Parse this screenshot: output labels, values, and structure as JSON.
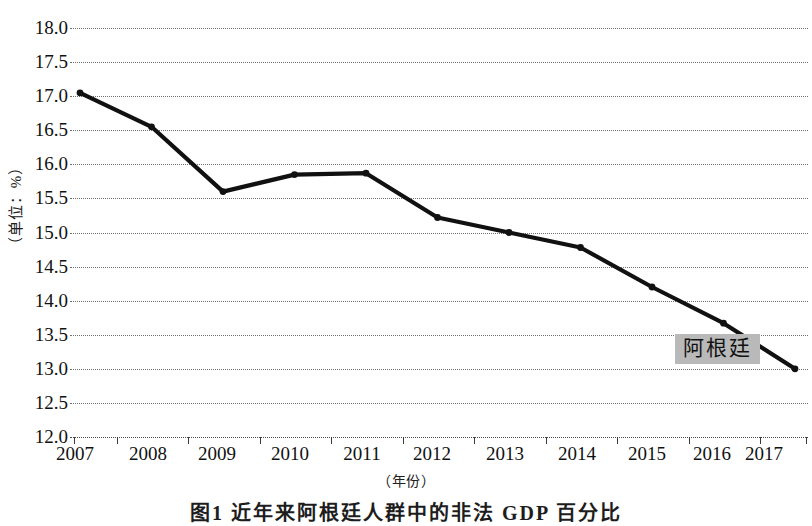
{
  "chart_data": {
    "type": "line",
    "title": "",
    "xlabel": "（年份）",
    "ylabel": "（单位：%）",
    "x": [
      2007,
      2008,
      2009,
      2010,
      2011,
      2012,
      2013,
      2014,
      2015,
      2016,
      2017
    ],
    "categories": [
      "2007",
      "2008",
      "2009",
      "2010",
      "2011",
      "2012",
      "2013",
      "2014",
      "2015",
      "2016",
      "2017"
    ],
    "series": [
      {
        "name": "阿根廷",
        "values": [
          17.05,
          16.55,
          15.6,
          15.85,
          15.87,
          15.22,
          15.0,
          14.78,
          14.2,
          13.67,
          13.0
        ]
      }
    ],
    "ylim": [
      12.0,
      18.0
    ],
    "ytick_labels": [
      "18.0",
      "17.5",
      "17.0",
      "16.5",
      "16.0",
      "15.5",
      "15.0",
      "14.5",
      "14.0",
      "13.5",
      "13.0",
      "12.5",
      "12.0"
    ],
    "ytick_values": [
      18.0,
      17.5,
      17.0,
      16.5,
      16.0,
      15.5,
      15.0,
      14.5,
      14.0,
      13.5,
      13.0,
      12.5,
      12.0
    ],
    "grid": true,
    "grid_style": "dotted-horizontal",
    "legend_position": "inline-annotation",
    "line_color": "#111111",
    "marker_color": "#111111",
    "annotation_bg_color": "#b9b9b9"
  },
  "annotations": [
    {
      "label": "阿根廷",
      "x_value": 2016.55,
      "y_value": 13.28
    }
  ],
  "caption": {
    "text": "图1  近年来阿根廷人群中的非法 GDP 百分比"
  }
}
